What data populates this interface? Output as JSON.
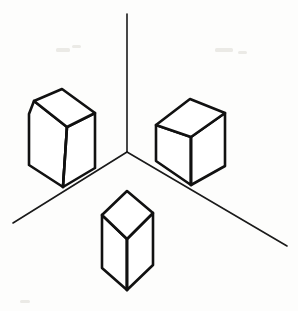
{
  "figure": {
    "canvas": {
      "width": 298,
      "height": 311,
      "background": "#fdfdfc"
    },
    "stroke_color": "#111111",
    "corner_stroke_color": "#1a1a1a",
    "face_fill": "#ffffff",
    "corner": {
      "name": "room-corner",
      "vertex": {
        "x": 127,
        "y": 152
      },
      "vertical_top": {
        "x": 127,
        "y": 14
      },
      "left_floor_end": {
        "x": 13,
        "y": 223
      },
      "right_floor_end": {
        "x": 287,
        "y": 246
      }
    },
    "blocks": [
      {
        "name": "left-block",
        "label": "Left block",
        "top_face": "34,101 62,89 95,113 67,127",
        "left_face": "34,101 29,114 29,165 63,187 67,127",
        "right_face": "67,127 95,113 95,168 63,187",
        "front_vertical_edge": {
          "x1": 67,
          "y1": 127,
          "x2": 63,
          "y2": 187
        }
      },
      {
        "name": "right-block",
        "label": "Right block",
        "top_face": "156,125 190,99 225,113 191,137",
        "left_face": "156,125 156,161 191,185 191,137",
        "right_face": "191,137 225,113 225,166 191,185",
        "front_vertical_edge": {
          "x1": 191,
          "y1": 137,
          "x2": 191,
          "y2": 185
        }
      },
      {
        "name": "bottom-block",
        "label": "Bottom block",
        "top_face": "102,215 127,191 153,213 127,239",
        "left_face": "102,215 102,268 127,290 127,239",
        "right_face": "127,239 153,213 153,265 127,290",
        "front_vertical_edge": {
          "x1": 127,
          "y1": 239,
          "x2": 127,
          "y2": 290
        }
      }
    ],
    "specks": [
      {
        "x": 56,
        "y": 48,
        "w": 14,
        "h": 4
      },
      {
        "x": 72,
        "y": 45,
        "w": 9,
        "h": 3
      },
      {
        "x": 215,
        "y": 48,
        "w": 18,
        "h": 4
      },
      {
        "x": 238,
        "y": 51,
        "w": 9,
        "h": 3
      },
      {
        "x": 20,
        "y": 300,
        "w": 10,
        "h": 3
      }
    ]
  }
}
